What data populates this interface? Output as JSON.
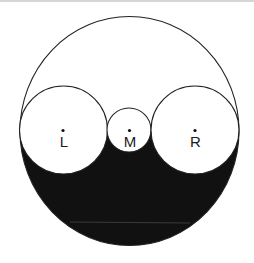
{
  "diagram": {
    "type": "arbelos-like circle figure",
    "outer_circle": {
      "cx": 129.5,
      "cy": 131,
      "r": 110.5
    },
    "baseline_y": 130,
    "fill_color": "#111111",
    "stroke_color": "#222222",
    "circles": [
      {
        "id": "L",
        "label": "L",
        "cx": 63.5,
        "cy": 130,
        "r": 44
      },
      {
        "id": "M",
        "label": "M",
        "cx": 129,
        "cy": 130,
        "r": 22
      },
      {
        "id": "R",
        "label": "R",
        "cx": 195,
        "cy": 130,
        "r": 44
      }
    ]
  }
}
